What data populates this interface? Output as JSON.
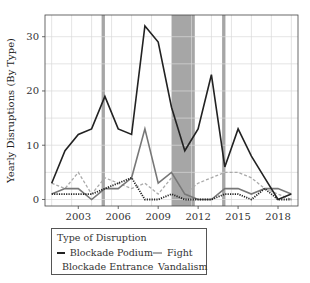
{
  "chart_data": {
    "type": "line",
    "title": "",
    "xlabel": "",
    "ylabel": "Yearly Disruptions (By Type)",
    "x": [
      2001,
      2002,
      2003,
      2004,
      2005,
      2006,
      2007,
      2008,
      2009,
      2010,
      2011,
      2012,
      2013,
      2014,
      2015,
      2016,
      2017,
      2018,
      2019
    ],
    "xlim": [
      2000.5,
      2019.5
    ],
    "ylim": [
      -1.2,
      34
    ],
    "x_ticks": [
      2003,
      2006,
      2009,
      2012,
      2015,
      2018
    ],
    "x_tick_labels": [
      "2003",
      "2006",
      "2009",
      "2012",
      "2015",
      "2018"
    ],
    "y_ticks": [
      0,
      10,
      20,
      30
    ],
    "y_tick_labels": [
      "0",
      "10",
      "20",
      "30"
    ],
    "grid": true,
    "shaded_periods": [
      {
        "start": 2004.75,
        "end": 2005.0
      },
      {
        "start": 2010.0,
        "end": 2011.75
      },
      {
        "start": 2013.8,
        "end": 2014.05
      }
    ],
    "series": [
      {
        "name": "Blockade Podium",
        "style": "solid",
        "color": "#222222",
        "values": [
          3,
          9,
          12,
          13,
          19,
          13,
          12,
          32,
          29,
          17,
          9,
          13,
          23,
          6,
          13,
          8,
          4,
          0,
          1
        ]
      },
      {
        "name": "Blockade Entrance",
        "style": "solid",
        "color": "#777777",
        "values": [
          1,
          2,
          2,
          0,
          2,
          2,
          4,
          13,
          3,
          5,
          1,
          0,
          0,
          2,
          2,
          1,
          2,
          2,
          1
        ]
      },
      {
        "name": "Fight",
        "style": "dashed",
        "color": "#aaaaaa",
        "values": [
          3,
          2,
          5,
          1,
          4,
          3,
          2,
          3,
          1,
          4,
          1,
          3,
          4,
          5,
          5,
          4,
          2,
          1,
          0
        ]
      },
      {
        "name": "Vandalism",
        "style": "dotted",
        "color": "#222222",
        "values": [
          1,
          1,
          1,
          1,
          2,
          3,
          4,
          0,
          0,
          1,
          0,
          0,
          0,
          1,
          1,
          0,
          2,
          0,
          0
        ]
      }
    ],
    "legend": {
      "title": "Type of Disruption",
      "placement": "bottom",
      "columns": 2
    }
  },
  "legend_labels": {
    "title": "Type of Disruption",
    "items": [
      "Blockade Podium",
      "Fight",
      "Blockade Entrance",
      "Vandalism"
    ]
  }
}
